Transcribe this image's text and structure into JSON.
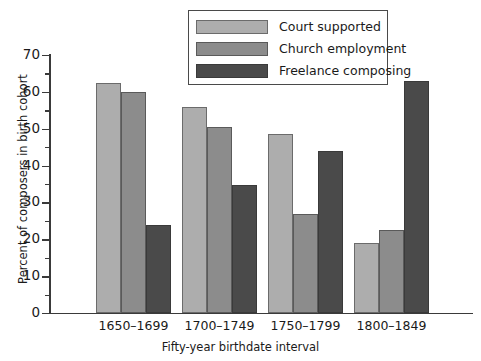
{
  "chart_data": {
    "type": "bar",
    "title": "",
    "xlabel": "Fifty-year birthdate interval",
    "ylabel": "Percent of composers in birth cohort",
    "categories": [
      "1650–1699",
      "1700–1749",
      "1750–1799",
      "1800–1849"
    ],
    "series": [
      {
        "name": "Court supported",
        "color": "#adadad",
        "values": [
          62.5,
          56.0,
          48.5,
          19.0
        ]
      },
      {
        "name": "Church employment",
        "color": "#8c8c8c",
        "values": [
          60.0,
          50.5,
          27.0,
          22.5
        ]
      },
      {
        "name": "Freelance composing",
        "color": "#4a4a4a",
        "values": [
          24.0,
          34.8,
          44.0,
          63.0
        ]
      }
    ],
    "ylim": [
      0,
      70
    ],
    "ytick_labels": [
      "0",
      "10",
      "20",
      "30",
      "40",
      "50",
      "60",
      "70"
    ],
    "ytick_values": [
      0,
      10,
      20,
      30,
      40,
      50,
      60,
      70
    ],
    "yminor_values": [
      5,
      15,
      25,
      35,
      45,
      55,
      65
    ],
    "grid": false,
    "legend_position": "top-center"
  },
  "axes": {
    "y_title": "Percent of composers in birth cohort",
    "x_title": "Fifty-year birthdate interval"
  },
  "legend": {
    "entries": [
      {
        "label": "Court supported"
      },
      {
        "label": "Church employment"
      },
      {
        "label": "Freelance composing"
      }
    ]
  }
}
